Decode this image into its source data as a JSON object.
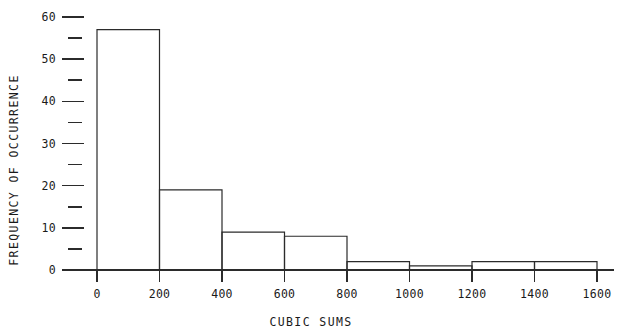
{
  "chart_data": {
    "type": "bar",
    "title": "",
    "subtitle": "",
    "xlabel": "CUBIC SUMS",
    "ylabel": "FREQUENCY OF OCCURRENCE",
    "grid": false,
    "legend": "none",
    "bin_width": 200,
    "bin_edges": [
      0,
      200,
      400,
      600,
      800,
      1000,
      1200,
      1400,
      1600
    ],
    "categories": [
      "0-200",
      "200-400",
      "400-600",
      "600-800",
      "800-1000",
      "1000-1200",
      "1200-1400",
      "1400-1600"
    ],
    "values": [
      57,
      19,
      9,
      8,
      2,
      1,
      2,
      2
    ],
    "xlim": [
      0,
      1600
    ],
    "ylim": [
      0,
      60
    ],
    "x_ticks": [
      0,
      200,
      400,
      600,
      800,
      1000,
      1200,
      1400,
      1600
    ],
    "x_tick_labels": [
      "0",
      "200",
      "400",
      "600",
      "800",
      "1000",
      "1200",
      "1400",
      "1600"
    ],
    "y_ticks": [
      0,
      10,
      20,
      30,
      40,
      50,
      60
    ],
    "y_tick_labels": [
      "0",
      "10",
      "20",
      "30",
      "40",
      "50",
      "60"
    ],
    "y_minor_ticks": [
      5,
      15,
      25,
      35,
      45,
      55
    ]
  }
}
